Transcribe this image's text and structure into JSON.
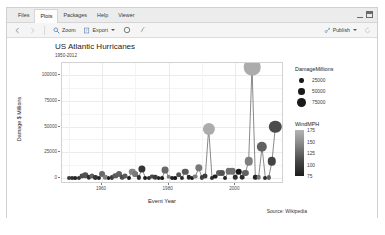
{
  "window": {
    "tabs": [
      {
        "label": "Files",
        "active": false
      },
      {
        "label": "Plots",
        "active": true
      },
      {
        "label": "Packages",
        "active": false
      },
      {
        "label": "Help",
        "active": false
      },
      {
        "label": "Viewer",
        "active": false
      }
    ],
    "controls": {
      "minimize": "minimize-icon",
      "maximize": "maximize-icon"
    }
  },
  "toolbar": {
    "back_icon": "back-arrow-icon",
    "forward_icon": "forward-arrow-icon",
    "zoom_label": "Zoom",
    "zoom_icon": "magnifier-icon",
    "export_label": "Export",
    "export_icon": "export-icon",
    "remove_icon": "remove-plot-icon",
    "clear_icon": "broom-clear-icon",
    "publish_label": "Publish",
    "publish_icon": "publish-icon",
    "refresh_icon": "refresh-icon"
  },
  "chart_data": {
    "type": "scatter",
    "title": "US Atlantic Hurricanes",
    "subtitle": "1950-2012",
    "xlabel": "Event Year",
    "ylabel": "Damage $ Millions",
    "caption": "Source: Wikipedia",
    "xlim": [
      1948,
      2014
    ],
    "ylim": [
      -4000,
      112000
    ],
    "xticks": [
      1960,
      1980,
      2000
    ],
    "yticks": [
      0,
      25000,
      50000,
      75000,
      100000
    ],
    "ytick_labels": [
      "0",
      "25000",
      "50000",
      "75000",
      "100000"
    ],
    "grid": true,
    "legends": [
      {
        "name": "DamageMillions",
        "type": "size",
        "values": [
          25000,
          50000,
          75000
        ],
        "labels": [
          "25000",
          "50000",
          "75000"
        ]
      },
      {
        "name": "WindMPH",
        "type": "colorbar",
        "ticks": [
          75,
          100,
          125,
          150,
          175
        ],
        "tick_labels": [
          "75",
          "100",
          "125",
          "150",
          "175"
        ],
        "low_color": "#1c1c1c",
        "high_color": "#b4b4b4"
      }
    ],
    "points": [
      {
        "x": 1950,
        "y": 200,
        "w": 100
      },
      {
        "x": 1951,
        "y": 150,
        "w": 90
      },
      {
        "x": 1952,
        "y": 100,
        "w": 85
      },
      {
        "x": 1953,
        "y": 300,
        "w": 95
      },
      {
        "x": 1954,
        "y": 1500,
        "w": 110
      },
      {
        "x": 1955,
        "y": 2600,
        "w": 115
      },
      {
        "x": 1956,
        "y": 500,
        "w": 90
      },
      {
        "x": 1957,
        "y": 1800,
        "w": 125
      },
      {
        "x": 1958,
        "y": 400,
        "w": 95
      },
      {
        "x": 1959,
        "y": 300,
        "w": 85
      },
      {
        "x": 1960,
        "y": 3900,
        "w": 130
      },
      {
        "x": 1961,
        "y": 700,
        "w": 145
      },
      {
        "x": 1962,
        "y": 120,
        "w": 80
      },
      {
        "x": 1963,
        "y": 400,
        "w": 100
      },
      {
        "x": 1964,
        "y": 2300,
        "w": 120
      },
      {
        "x": 1965,
        "y": 4200,
        "w": 125
      },
      {
        "x": 1966,
        "y": 800,
        "w": 110
      },
      {
        "x": 1967,
        "y": 1400,
        "w": 120
      },
      {
        "x": 1968,
        "y": 200,
        "w": 80
      },
      {
        "x": 1969,
        "y": 6000,
        "w": 150
      },
      {
        "x": 1970,
        "y": 3500,
        "w": 140
      },
      {
        "x": 1971,
        "y": 400,
        "w": 90
      },
      {
        "x": 1972,
        "y": 9000,
        "w": 95
      },
      {
        "x": 1973,
        "y": 150,
        "w": 80
      },
      {
        "x": 1974,
        "y": 300,
        "w": 90
      },
      {
        "x": 1975,
        "y": 1200,
        "w": 110
      },
      {
        "x": 1976,
        "y": 800,
        "w": 100
      },
      {
        "x": 1977,
        "y": 100,
        "w": 85
      },
      {
        "x": 1978,
        "y": 120,
        "w": 80
      },
      {
        "x": 1979,
        "y": 7500,
        "w": 130
      },
      {
        "x": 1980,
        "y": 1100,
        "w": 145
      },
      {
        "x": 1981,
        "y": 150,
        "w": 85
      },
      {
        "x": 1982,
        "y": 100,
        "w": 75
      },
      {
        "x": 1983,
        "y": 3000,
        "w": 115
      },
      {
        "x": 1984,
        "y": 300,
        "w": 90
      },
      {
        "x": 1985,
        "y": 6000,
        "w": 120
      },
      {
        "x": 1986,
        "y": 500,
        "w": 85
      },
      {
        "x": 1987,
        "y": 200,
        "w": 80
      },
      {
        "x": 1988,
        "y": 1200,
        "w": 145
      },
      {
        "x": 1989,
        "y": 9500,
        "w": 140
      },
      {
        "x": 1990,
        "y": 400,
        "w": 100
      },
      {
        "x": 1991,
        "y": 1800,
        "w": 100
      },
      {
        "x": 1992,
        "y": 48000,
        "w": 175
      },
      {
        "x": 1993,
        "y": 300,
        "w": 90
      },
      {
        "x": 1994,
        "y": 1200,
        "w": 80
      },
      {
        "x": 1995,
        "y": 4500,
        "w": 125
      },
      {
        "x": 1996,
        "y": 5000,
        "w": 115
      },
      {
        "x": 1997,
        "y": 200,
        "w": 85
      },
      {
        "x": 1998,
        "y": 6500,
        "w": 135
      },
      {
        "x": 1999,
        "y": 6800,
        "w": 135
      },
      {
        "x": 2000,
        "y": 700,
        "w": 90
      },
      {
        "x": 2001,
        "y": 6000,
        "w": 75
      },
      {
        "x": 2002,
        "y": 1000,
        "w": 90
      },
      {
        "x": 2003,
        "y": 5000,
        "w": 125
      },
      {
        "x": 2004,
        "y": 16000,
        "w": 145
      },
      {
        "x": 2005,
        "y": 108000,
        "w": 175
      },
      {
        "x": 2006,
        "y": 500,
        "w": 85
      },
      {
        "x": 2007,
        "y": 1000,
        "w": 140
      },
      {
        "x": 2008,
        "y": 30000,
        "w": 125
      },
      {
        "x": 2009,
        "y": 200,
        "w": 90
      },
      {
        "x": 2010,
        "y": 400,
        "w": 125
      },
      {
        "x": 2011,
        "y": 16000,
        "w": 105
      },
      {
        "x": 2012,
        "y": 50000,
        "w": 110
      }
    ]
  }
}
